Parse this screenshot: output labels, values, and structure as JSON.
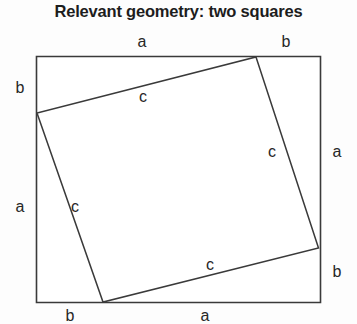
{
  "title": "Relevant geometry: two squares",
  "figure": {
    "name": "two-squares-pythagorean-diagram",
    "stroke_color": "#3a3a3a",
    "fill_color": "#ffffff",
    "background": "#fdfdfd",
    "outer_square": {
      "label": "outer-square",
      "corners": [
        {
          "x": 36.5,
          "y": 56.5
        },
        {
          "x": 320.5,
          "y": 56.5
        },
        {
          "x": 320.5,
          "y": 302.5
        },
        {
          "x": 36.5,
          "y": 302.5
        }
      ]
    },
    "inner_square": {
      "label": "inner-tilted-square",
      "corners": [
        {
          "x": 256,
          "y": 57
        },
        {
          "x": 318.5,
          "y": 248
        },
        {
          "x": 103,
          "y": 302
        },
        {
          "x": 37,
          "y": 113
        }
      ]
    },
    "labels": [
      {
        "id": "top-a",
        "text": "a",
        "x": 142,
        "y": 42
      },
      {
        "id": "top-b",
        "text": "b",
        "x": 286,
        "y": 42
      },
      {
        "id": "left-b",
        "text": "b",
        "x": 20,
        "y": 88
      },
      {
        "id": "left-a",
        "text": "a",
        "x": 20,
        "y": 207
      },
      {
        "id": "right-a",
        "text": "a",
        "x": 337,
        "y": 152
      },
      {
        "id": "right-b",
        "text": "b",
        "x": 337,
        "y": 272
      },
      {
        "id": "bottom-b",
        "text": "b",
        "x": 70,
        "y": 316
      },
      {
        "id": "bottom-a",
        "text": "a",
        "x": 205,
        "y": 316
      },
      {
        "id": "hyp-top",
        "text": "c",
        "x": 143,
        "y": 97
      },
      {
        "id": "hyp-left",
        "text": "c",
        "x": 75,
        "y": 207
      },
      {
        "id": "hyp-right",
        "text": "c",
        "x": 272,
        "y": 152
      },
      {
        "id": "hyp-bottom",
        "text": "c",
        "x": 210,
        "y": 265
      }
    ]
  }
}
